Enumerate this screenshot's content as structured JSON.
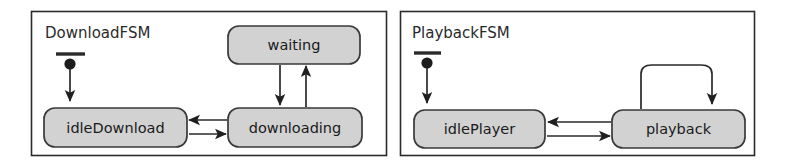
{
  "diagram": {
    "type": "uml-state-machine",
    "title": "",
    "background_color": "#ffffff",
    "state_fill_color": "#d2d2d2",
    "state_stroke_color": "#3a3a3a",
    "line_color": "#2a2a2a",
    "panels": [
      {
        "id": "download-fsm",
        "title": "DownloadFSM",
        "states": [
          {
            "id": "idleDownload",
            "label": "idleDownload"
          },
          {
            "id": "downloading",
            "label": "downloading"
          },
          {
            "id": "waiting",
            "label": "waiting"
          }
        ],
        "initial_state": "idleDownload",
        "transitions": [
          {
            "from": "idleDownload",
            "to": "downloading",
            "label": ""
          },
          {
            "from": "downloading",
            "to": "idleDownload",
            "label": ""
          },
          {
            "from": "downloading",
            "to": "waiting",
            "label": ""
          },
          {
            "from": "waiting",
            "to": "downloading",
            "label": ""
          }
        ]
      },
      {
        "id": "playback-fsm",
        "title": "PlaybackFSM",
        "states": [
          {
            "id": "idlePlayer",
            "label": "idlePlayer"
          },
          {
            "id": "playback",
            "label": "playback"
          }
        ],
        "initial_state": "idlePlayer",
        "transitions": [
          {
            "from": "idlePlayer",
            "to": "playback",
            "label": ""
          },
          {
            "from": "playback",
            "to": "idlePlayer",
            "label": ""
          },
          {
            "from": "playback",
            "to": "playback",
            "label": ""
          }
        ]
      }
    ]
  }
}
